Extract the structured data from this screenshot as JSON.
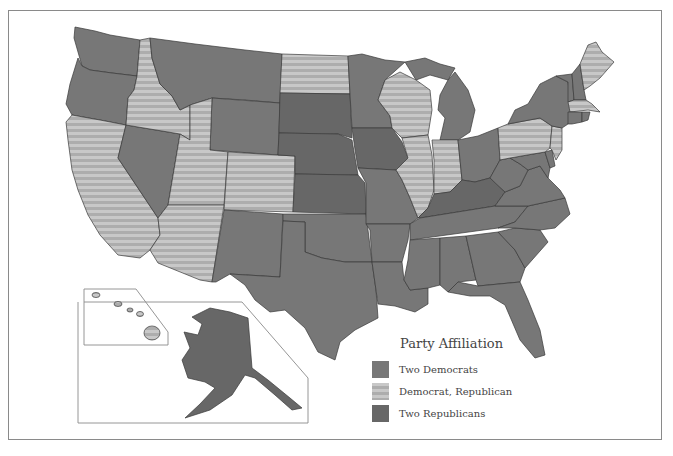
{
  "map": {
    "legend": {
      "title": "Party Affiliation",
      "items": [
        {
          "key": "dem",
          "label": "Two Democrats",
          "color": "#777777"
        },
        {
          "key": "split",
          "label": "Democrat, Republican",
          "color": "#c4c4c4",
          "pattern": "horizontal-stripes",
          "stripe_color": "#aeaeae"
        },
        {
          "key": "rep",
          "label": "Two Republicans",
          "color": "#676767"
        }
      ]
    },
    "states": {
      "WA": "dem",
      "OR": "dem",
      "CA": "split",
      "NV": "dem",
      "ID": "split",
      "MT": "dem",
      "WY": "dem",
      "UT": "split",
      "CO": "split",
      "AZ": "split",
      "NM": "dem",
      "ND": "split",
      "SD": "rep",
      "NE": "rep",
      "KS": "rep",
      "OK": "dem",
      "TX": "dem",
      "MN": "dem",
      "IA": "rep",
      "MO": "dem",
      "AR": "dem",
      "LA": "dem",
      "WI": "split",
      "IL": "split",
      "MI": "dem",
      "IN": "split",
      "OH": "dem",
      "KY": "rep",
      "TN": "dem",
      "MS": "dem",
      "AL": "dem",
      "GA": "dem",
      "FL": "dem",
      "SC": "dem",
      "NC": "dem",
      "VA": "dem",
      "WV": "dem",
      "MD": "dem",
      "DE": "dem",
      "PA": "split",
      "NJ": "split",
      "NY": "dem",
      "CT": "dem",
      "RI": "dem",
      "MA": "split",
      "VT": "dem",
      "NH": "dem",
      "ME": "split",
      "AK": "rep",
      "HI": "split"
    }
  }
}
